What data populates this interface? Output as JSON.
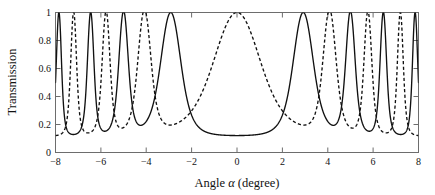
{
  "chart_data": {
    "type": "line",
    "title": "",
    "xlabel": "Angle α (degree)",
    "ylabel": "Transmission",
    "xlim": [
      -8,
      8
    ],
    "ylim": [
      0,
      1
    ],
    "xticks": [
      -8,
      -6,
      -4,
      -2,
      0,
      2,
      4,
      6,
      8
    ],
    "xticklabels": [
      "−8",
      "−6",
      "−4",
      "−2",
      "0",
      "2",
      "4",
      "6",
      "8"
    ],
    "yticks": [
      0,
      0.2,
      0.4,
      0.6,
      0.8,
      1
    ],
    "yticklabels": [
      "0",
      "0.2",
      "0.4",
      "0.6",
      "0.8",
      "1"
    ],
    "grid": false,
    "legend": "none",
    "baseline_min": 0.115,
    "peak_max": 1.0,
    "series": [
      {
        "name": "solid",
        "style": "solid",
        "color": "#111111",
        "peak_centers": [
          -7.85,
          -6.45,
          -5.0,
          -2.92,
          2.92,
          5.0,
          6.45,
          7.85
        ],
        "peak_halfwidths": [
          0.16,
          0.2,
          0.29,
          0.62,
          0.62,
          0.29,
          0.2,
          0.16
        ],
        "notes": "central order is suppressed; flat floor between -2 and 2"
      },
      {
        "name": "dashed",
        "style": "dashed",
        "color": "#111111",
        "peak_centers": [
          -7.2,
          -5.77,
          -4.08,
          0.0,
          4.08,
          5.77,
          7.2
        ],
        "peak_halfwidths": [
          0.18,
          0.24,
          0.4,
          1.45,
          0.4,
          0.24,
          0.18
        ],
        "notes": "broad central resonance centred at 0 degrees"
      }
    ]
  },
  "axes": {
    "x_title": "Angle α (degree)",
    "x_title_prefix": "Angle ",
    "x_title_symbol": "α",
    "x_title_suffix": " (degree)",
    "y_title": "Transmission"
  },
  "ticks": {
    "x": [
      "−8",
      "−6",
      "−4",
      "−2",
      "0",
      "2",
      "4",
      "6",
      "8"
    ],
    "y": [
      "0",
      "0.2",
      "0.4",
      "0.6",
      "0.8",
      "1"
    ]
  },
  "colors": {
    "curve": "#111111",
    "frame": "#6d6d6d",
    "background": "#ffffff"
  }
}
